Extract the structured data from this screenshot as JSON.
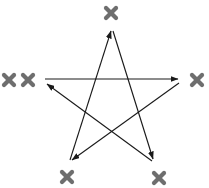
{
  "diagram": {
    "type": "directed-star",
    "stroke_color": "#1a1a1a",
    "mark_color": "#6e6e6e",
    "vertices": [
      {
        "id": "top",
        "x": 112,
        "y": 31
      },
      {
        "id": "right",
        "x": 179,
        "y": 81
      },
      {
        "id": "bottom-right",
        "x": 153,
        "y": 161
      },
      {
        "id": "bottom-left",
        "x": 71,
        "y": 161
      },
      {
        "id": "left",
        "x": 45,
        "y": 81
      }
    ],
    "edges": [
      {
        "from": "left",
        "to": "right",
        "x1": 45,
        "y1": 79,
        "x2": 178,
        "y2": 79
      },
      {
        "from": "right",
        "to": "bottom-left",
        "x1": 179,
        "y1": 83,
        "x2": 72,
        "y2": 160
      },
      {
        "from": "bottom-left",
        "to": "top",
        "x1": 70,
        "y1": 160,
        "x2": 111,
        "y2": 31
      },
      {
        "from": "top",
        "to": "bottom-right",
        "x1": 113,
        "y1": 31,
        "x2": 153,
        "y2": 159
      },
      {
        "from": "bottom-right",
        "to": "left",
        "x1": 152,
        "y1": 161,
        "x2": 47,
        "y2": 84
      }
    ],
    "marks": [
      {
        "id": "mark-top",
        "vertex": "top",
        "x": 111,
        "y": 13,
        "count": 1
      },
      {
        "id": "mark-right",
        "vertex": "right",
        "x": 197,
        "y": 80,
        "count": 1
      },
      {
        "id": "mark-bottom-right",
        "vertex": "bottom-right",
        "x": 159,
        "y": 178,
        "count": 1
      },
      {
        "id": "mark-bottom-left",
        "vertex": "bottom-left",
        "x": 67,
        "y": 177,
        "count": 1
      },
      {
        "id": "mark-left-1",
        "vertex": "left",
        "x": 9,
        "y": 80,
        "count": 2
      },
      {
        "id": "mark-left-2",
        "vertex": "left",
        "x": 28,
        "y": 80,
        "count": 2
      }
    ]
  }
}
